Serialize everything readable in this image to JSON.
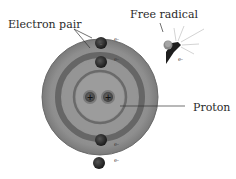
{
  "labels": {
    "electron_pair": "Electron pair",
    "free_radical": "Free radical",
    "proton": "Proton"
  },
  "symbols": {
    "electron": "e-",
    "proton_charge": "+"
  },
  "colors": {
    "outer_shell": "#9a9a9a",
    "inner_ring": "#6e6e6e",
    "nucleus": "#8c8c8c",
    "electron": "#2b2b2b",
    "text": "#2a2a2a"
  }
}
